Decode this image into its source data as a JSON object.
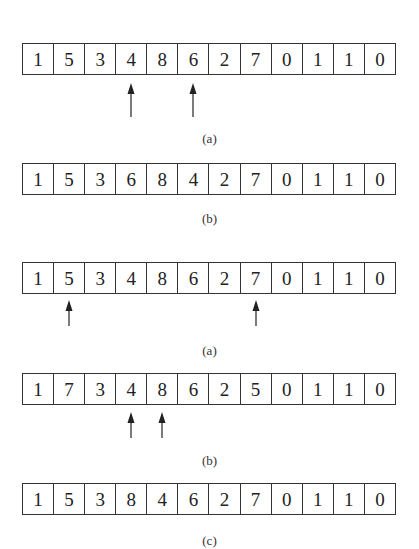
{
  "figures": [
    {
      "rows": [
        {
          "top": 43,
          "cells": [
            "1",
            "5",
            "3",
            "4",
            "8",
            "6",
            "2",
            "7",
            "0",
            "1",
            "1",
            "0"
          ],
          "arrows": [
            3,
            5
          ],
          "arrow_top": 83,
          "arrow_height": 34
        },
        {
          "top": 163,
          "cells": [
            "1",
            "5",
            "3",
            "6",
            "8",
            "4",
            "2",
            "7",
            "0",
            "1",
            "1",
            "0"
          ],
          "arrows": [],
          "arrow_top": 0,
          "arrow_height": 0
        }
      ],
      "labels": [
        {
          "text": "(a)",
          "top": 131
        },
        {
          "text": "(b)",
          "top": 211
        }
      ]
    },
    {
      "rows": [
        {
          "top": 262,
          "cells": [
            "1",
            "5",
            "3",
            "4",
            "8",
            "6",
            "2",
            "7",
            "0",
            "1",
            "1",
            "0"
          ],
          "arrows": [
            1,
            7
          ],
          "arrow_top": 300,
          "arrow_height": 26
        },
        {
          "top": 373,
          "cells": [
            "1",
            "7",
            "3",
            "4",
            "8",
            "6",
            "2",
            "5",
            "0",
            "1",
            "1",
            "0"
          ],
          "arrows": [
            3,
            4
          ],
          "arrow_top": 412,
          "arrow_height": 26
        },
        {
          "top": 483,
          "cells": [
            "1",
            "5",
            "3",
            "8",
            "4",
            "6",
            "2",
            "7",
            "0",
            "1",
            "1",
            "0"
          ],
          "arrows": [],
          "arrow_top": 0,
          "arrow_height": 0
        }
      ],
      "labels": [
        {
          "text": "(a)",
          "top": 343
        },
        {
          "text": "(b)",
          "top": 453
        },
        {
          "text": "(c)",
          "top": 533
        }
      ]
    }
  ]
}
